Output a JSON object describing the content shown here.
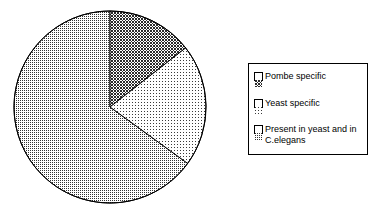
{
  "chart_data": {
    "type": "pie",
    "title": "",
    "subtitle": "",
    "xlabel": "",
    "ylabel": "",
    "grid": false,
    "legend_position": "right",
    "start_angle_deg": 0,
    "direction": "clockwise",
    "categories": [
      "Pombe specific",
      "Yeast specific",
      "Present in yeast and in\nC.elegans"
    ],
    "values": [
      14.5,
      20.5,
      65.0
    ],
    "units": "percent",
    "slices": [
      {
        "label": "Pombe specific",
        "value": 14.5,
        "start_deg": 0,
        "end_deg": 52,
        "fill_pattern": "dense-dark-checker",
        "fill_color": "#595959",
        "edge_color": "#000000"
      },
      {
        "label": "Yeast specific",
        "value": 20.5,
        "start_deg": 52,
        "end_deg": 126,
        "fill_pattern": "sparse-light-dots",
        "fill_color": "#d9d9d9",
        "edge_color": "#000000"
      },
      {
        "label": "Present in yeast and in\nC.elegans",
        "value": 65.0,
        "start_deg": 126,
        "end_deg": 360,
        "fill_pattern": "medium-gray-dots",
        "fill_color": "#a6a6a6",
        "edge_color": "#000000"
      }
    ]
  },
  "legend": {
    "border_color": "#000000",
    "background_color": "#ffffff",
    "items": [
      {
        "label": "Pombe specific",
        "swatch": "swatch-dense-dark-checker"
      },
      {
        "label": "Yeast specific",
        "swatch": "swatch-sparse-light-dots"
      },
      {
        "label": "Present in yeast and in\nC.elegans",
        "swatch": "swatch-medium-gray-dots"
      }
    ]
  },
  "colors": {
    "background": "#ffffff",
    "outline": "#000000",
    "slice_dark": "#595959",
    "slice_light": "#d9d9d9",
    "slice_medium": "#a6a6a6"
  }
}
